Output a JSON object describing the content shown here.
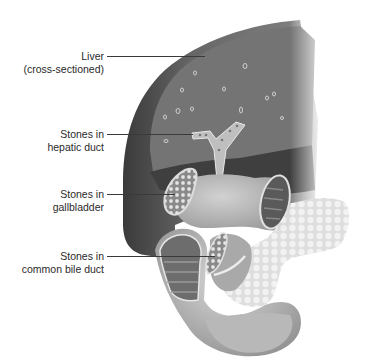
{
  "diagram": {
    "colors": {
      "background": "#ffffff",
      "liver_dark": "#3d3d3d",
      "liver_mid": "#6a6a6a",
      "liver_light": "#8c8c8c",
      "organ_light": "#c8c8c8",
      "pancreas": "#dedede",
      "text": "#2a2a2a",
      "leader_line": "#3a3a3a"
    },
    "labels": [
      {
        "id": "liver",
        "line1": "Liver",
        "line2": "(cross-sectioned)"
      },
      {
        "id": "hepatic-duct",
        "line1": "Stones in",
        "line2": "hepatic duct"
      },
      {
        "id": "gallbladder",
        "line1": "Stones in",
        "line2": "gallbladder"
      },
      {
        "id": "common-bile-duct",
        "line1": "Stones in",
        "line2": "common bile duct"
      }
    ]
  }
}
